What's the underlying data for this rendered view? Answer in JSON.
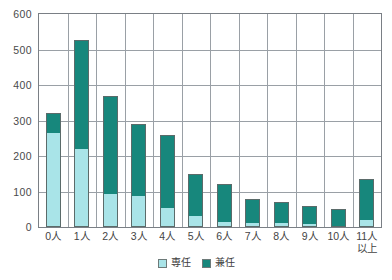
{
  "chart_data": {
    "type": "bar",
    "subtype": "stacked-vertical",
    "title": "",
    "xlabel": "",
    "ylabel": "",
    "ylim": [
      0,
      600
    ],
    "ytick_step": 100,
    "yticks": [
      0,
      100,
      200,
      300,
      400,
      500,
      600
    ],
    "grid": true,
    "grid_axis": "both",
    "legend_position": "bottom-center",
    "categories": [
      "0人",
      "1人",
      "2人",
      "3人",
      "4人",
      "5人",
      "6人",
      "7人",
      "8人",
      "9人",
      "10人",
      "11人以上"
    ],
    "category_lines": [
      [
        "0人"
      ],
      [
        "1人"
      ],
      [
        "2人"
      ],
      [
        "3人"
      ],
      [
        "4人"
      ],
      [
        "5人"
      ],
      [
        "6人"
      ],
      [
        "7人"
      ],
      [
        "8人"
      ],
      [
        "9人"
      ],
      [
        "10人"
      ],
      [
        "11人",
        "以上"
      ]
    ],
    "series": [
      {
        "name": "専任",
        "color": "#a9e4e8",
        "values": [
          268,
          218,
          92,
          85,
          53,
          28,
          12,
          10,
          8,
          6,
          0,
          18
        ]
      },
      {
        "name": "兼任",
        "color": "#17877c",
        "values": [
          54,
          309,
          278,
          205,
          207,
          122,
          108,
          70,
          62,
          52,
          50,
          117
        ]
      }
    ],
    "totals": [
      322,
      527,
      370,
      290,
      260,
      150,
      120,
      80,
      70,
      58,
      50,
      135
    ]
  },
  "legend": {
    "items": [
      {
        "label": "専任",
        "color": "#a9e4e8"
      },
      {
        "label": "兼任",
        "color": "#17877c"
      }
    ]
  },
  "axis": {
    "y_max": 600,
    "y_min": 0,
    "y_labels": [
      "600",
      "500",
      "400",
      "300",
      "200",
      "100",
      "0"
    ]
  },
  "colors": {
    "senin": "#a9e4e8",
    "kennin": "#17877c",
    "grid": "#9aa0a6",
    "frame": "#7a7f85",
    "text": "#444444",
    "background": "#ffffff"
  }
}
